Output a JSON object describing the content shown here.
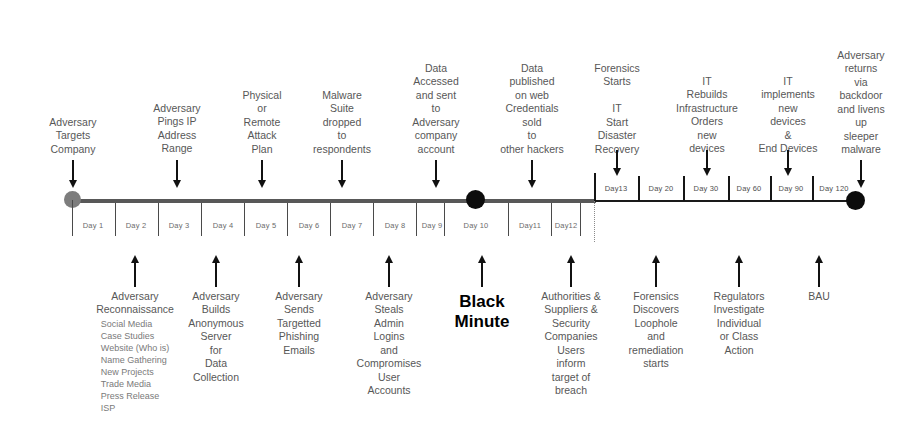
{
  "diagram": {
    "colors": {
      "start_node": "#7d7d7d",
      "black_minute_node": "#0c0c0c",
      "end_node": "#0c0c0c",
      "axis": "#585858",
      "text": "#575757"
    }
  },
  "axis": {
    "lower_day_labels": [
      "Day 1",
      "Day 2",
      "Day 3",
      "Day 4",
      "Day 5",
      "Day 6",
      "Day 7",
      "Day 8",
      "Day 9",
      "Day 10",
      "Day11",
      "Day12"
    ],
    "upper_day_labels": [
      "Day13",
      "Day 20",
      "Day 30",
      "Day 60",
      "Day 90",
      "Day 120"
    ]
  },
  "events_above": [
    {
      "id": "adversary-targets-company",
      "lines": [
        "Adversary",
        "Targets",
        "Company"
      ]
    },
    {
      "id": "adversary-pings-ip-address-range",
      "lines": [
        "Adversary",
        "Pings IP",
        "Address",
        "Range"
      ]
    },
    {
      "id": "physical-or-remote-attack-plan",
      "lines": [
        "Physical",
        "or",
        "Remote",
        "Attack",
        "Plan"
      ]
    },
    {
      "id": "malware-suite-dropped",
      "lines": [
        "Malware",
        "Suite",
        "dropped",
        "to",
        "respondents"
      ]
    },
    {
      "id": "data-accessed-and-sent",
      "lines": [
        "Data",
        "Accessed",
        "and sent",
        "to",
        "Adversary",
        "company",
        "account"
      ]
    },
    {
      "id": "data-published-on-web",
      "lines": [
        "Data",
        "published",
        "on web",
        "Credentials",
        "sold",
        "to",
        "other hackers"
      ]
    },
    {
      "id": "forensics-starts-it-disaster-recovery",
      "lines": [
        "Forensics",
        "Starts",
        "",
        "IT",
        "Start",
        "Disaster",
        "Recovery"
      ]
    },
    {
      "id": "it-rebuilds-infrastructure",
      "lines": [
        "IT",
        "Rebuilds",
        "Infrastructure",
        "Orders",
        "new",
        "devices"
      ]
    },
    {
      "id": "it-implements-new-devices",
      "lines": [
        "IT",
        "implements",
        "new",
        "devices",
        "&",
        "End Devices"
      ]
    },
    {
      "id": "adversary-returns-via-backdoor",
      "lines": [
        "Adversary",
        "returns",
        "via",
        "backdoor",
        "and livens",
        "up",
        "sleeper",
        "malware"
      ]
    }
  ],
  "events_below": [
    {
      "id": "adversary-reconnaissance",
      "lines": [
        "Adversary",
        "Reconnaissance"
      ],
      "sub_items": [
        "Social Media",
        "Case Studies",
        "Website (Who is)",
        "Name Gathering",
        "New Projects",
        "Trade Media",
        "Press Release",
        "ISP"
      ]
    },
    {
      "id": "adversary-builds-anonymous-server",
      "lines": [
        "Adversary",
        "Builds",
        "Anonymous",
        "Server",
        "for",
        "Data",
        "Collection"
      ],
      "sub_items": []
    },
    {
      "id": "adversary-sends-targetted-phishing-emails",
      "lines": [
        "Adversary",
        "Sends",
        "Targetted",
        "Phishing",
        "Emails"
      ],
      "sub_items": []
    },
    {
      "id": "adversary-steals-admin-logins",
      "lines": [
        "Adversary",
        "Steals",
        "Admin",
        "Logins",
        "and",
        "Compromises",
        "User",
        "Accounts"
      ],
      "sub_items": []
    },
    {
      "id": "black-minute",
      "lines": [
        "Black",
        "Minute"
      ],
      "sub_items": [],
      "emphasis": true
    },
    {
      "id": "authorities-suppliers-security-companies",
      "lines": [
        "Authorities &",
        "Suppliers &",
        "Security",
        "Companies",
        "Users",
        "inform",
        "target  of",
        "breach"
      ],
      "sub_items": []
    },
    {
      "id": "forensics-discovers-loophole",
      "lines": [
        "Forensics",
        "Discovers",
        "Loophole",
        "and",
        "remediation",
        "starts"
      ],
      "sub_items": []
    },
    {
      "id": "regulators-investigate",
      "lines": [
        "Regulators",
        "Investigate",
        "Individual",
        "or Class",
        "Action"
      ],
      "sub_items": []
    },
    {
      "id": "bau",
      "lines": [
        "BAU"
      ],
      "sub_items": []
    }
  ]
}
